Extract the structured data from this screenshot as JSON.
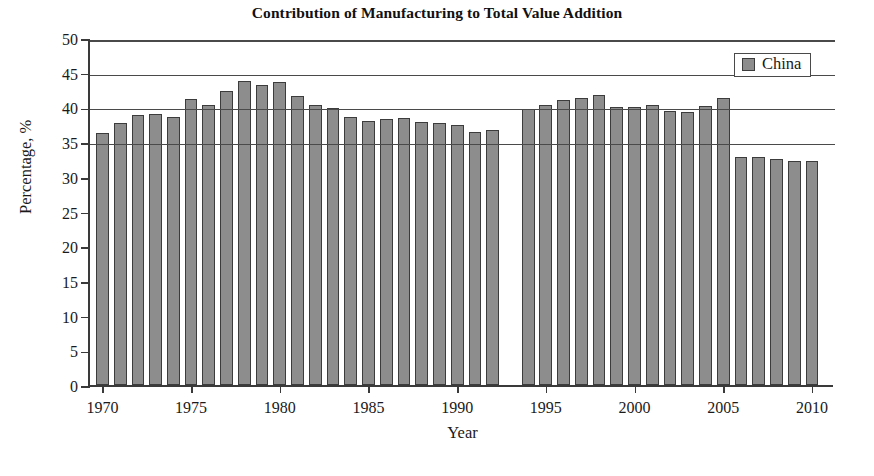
{
  "chart": {
    "title": "Contribution of Manufacturing to Total Value Addition",
    "xlabel": "Year",
    "ylabel": "Percentage, %",
    "legend_label": "China",
    "bar_color": "#8d8d8d",
    "bar_edge_color": "#3c3c3c",
    "axis_color": "#3a3a3a"
  },
  "chart_data": {
    "type": "bar",
    "title": "Contribution of Manufacturing to Total Value Addition",
    "xlabel": "Year",
    "ylabel": "Percentage, %",
    "xlim": [
      1969.3,
      2011.3
    ],
    "ylim": [
      0,
      50
    ],
    "yticks": [
      0,
      5,
      10,
      15,
      20,
      25,
      30,
      35,
      40,
      45,
      50
    ],
    "ytick_labels": [
      "0",
      "5",
      "10",
      "15",
      "20",
      "25",
      "30",
      "35",
      "40",
      "45",
      "50"
    ],
    "xticks": [
      1970,
      1975,
      1980,
      1985,
      1990,
      1995,
      2000,
      2005,
      2010
    ],
    "xtick_labels": [
      "1970",
      "1975",
      "1980",
      "1985",
      "1990",
      "1995",
      "2000",
      "2005",
      "2010"
    ],
    "grid": "horizontal",
    "gridlines_at": [
      35,
      40,
      45,
      50
    ],
    "legend": {
      "position": "top-right",
      "entries": [
        "China"
      ]
    },
    "series": [
      {
        "name": "China",
        "color": "#8d8d8d",
        "x": [
          1970,
          1971,
          1972,
          1973,
          1974,
          1975,
          1976,
          1977,
          1978,
          1979,
          1980,
          1981,
          1982,
          1983,
          1984,
          1985,
          1986,
          1987,
          1988,
          1989,
          1990,
          1991,
          1992,
          1994,
          1995,
          1996,
          1997,
          1998,
          1999,
          2000,
          2001,
          2002,
          2003,
          2004,
          2005,
          2006,
          2007,
          2008,
          2009,
          2010
        ],
        "values": [
          36.3,
          37.8,
          38.9,
          39.0,
          38.6,
          41.2,
          40.3,
          42.4,
          43.8,
          43.3,
          43.6,
          41.7,
          40.4,
          39.9,
          38.6,
          38.1,
          38.4,
          38.5,
          37.9,
          37.7,
          37.4,
          36.5,
          36.7,
          39.8,
          40.3,
          41.0,
          41.3,
          41.8,
          40.1,
          40.1,
          40.3,
          39.5,
          39.4,
          40.2,
          41.4,
          32.9,
          32.8,
          32.6,
          32.3,
          32.3
        ],
        "missing_years": [
          1993
        ]
      }
    ]
  }
}
